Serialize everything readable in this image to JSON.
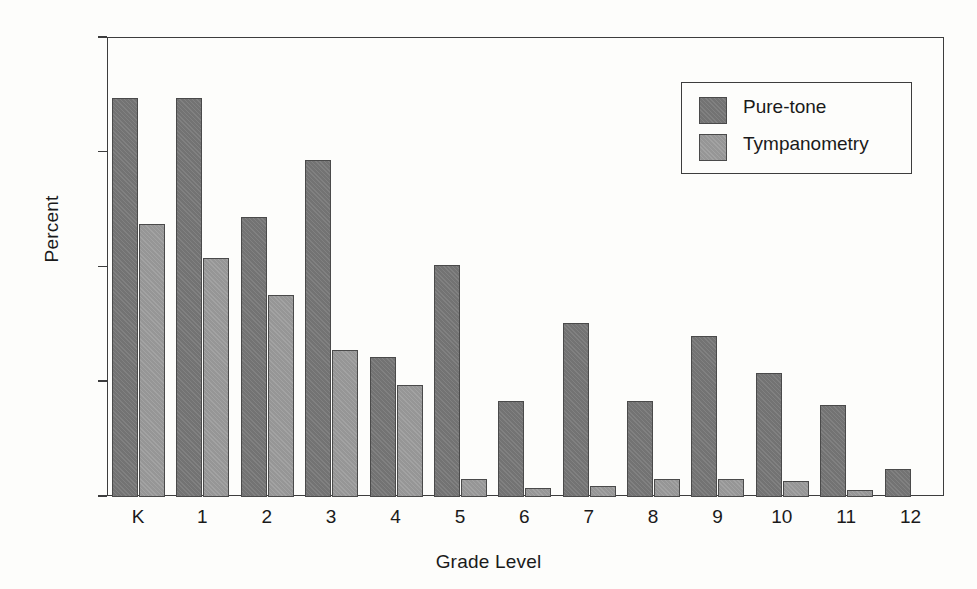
{
  "chart_data": {
    "type": "bar",
    "title": "",
    "xlabel": "Grade Level",
    "ylabel": "Percent",
    "categories": [
      "K",
      "1",
      "2",
      "3",
      "4",
      "5",
      "6",
      "7",
      "8",
      "9",
      "10",
      "11",
      "12"
    ],
    "series": [
      {
        "name": "Pure-tone",
        "color": "#737373",
        "values": [
          87,
          87,
          61,
          73.5,
          30.5,
          50.5,
          21,
          38,
          21,
          35,
          27,
          20,
          6
        ]
      },
      {
        "name": "Tympanometry",
        "color": "#969696",
        "values": [
          59.5,
          52,
          44,
          32,
          24.5,
          4,
          2,
          2.5,
          4,
          4,
          3.5,
          1.5,
          null
        ]
      }
    ],
    "ylim": [
      0,
      100
    ],
    "yticks": [
      0,
      25,
      50,
      75,
      100
    ],
    "ytick_labels": [
      "0",
      "25",
      "50",
      "75",
      "100"
    ],
    "grid": false,
    "legend_position": "top-right",
    "legend_entries": [
      "Pure-tone",
      "Tympanometry"
    ]
  },
  "axes": {
    "y_label": "Percent",
    "x_label": "Grade Level"
  },
  "legend": {
    "items": [
      {
        "label": "Pure-tone"
      },
      {
        "label": "Tympanometry"
      }
    ]
  }
}
